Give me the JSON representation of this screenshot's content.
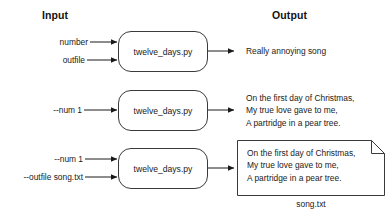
{
  "headings": {
    "input": "Input",
    "output": "Output"
  },
  "rows": [
    {
      "id": "row-1",
      "inputs": [
        "number",
        "outfile"
      ],
      "process": "twelve_days.py",
      "output_lines": [
        "Really annoying song"
      ],
      "output_is_file": false
    },
    {
      "id": "row-2",
      "inputs": [
        "--num 1"
      ],
      "process": "twelve_days.py",
      "output_lines": [
        "On the first day of Christmas,",
        "My true love gave to me,",
        "A partridge in a pear tree."
      ],
      "output_is_file": false
    },
    {
      "id": "row-3",
      "inputs": [
        "--num 1",
        "--outfile song.txt"
      ],
      "process": "twelve_days.py",
      "output_lines": [
        "On the first day of Christmas,",
        "My true love gave to me,",
        "A partridge in a pear tree."
      ],
      "output_is_file": true,
      "file_caption": "song.txt"
    }
  ],
  "colors": {
    "background": "#ffffff",
    "stroke": "#3a3a3a",
    "text": "#1a1a1a"
  }
}
